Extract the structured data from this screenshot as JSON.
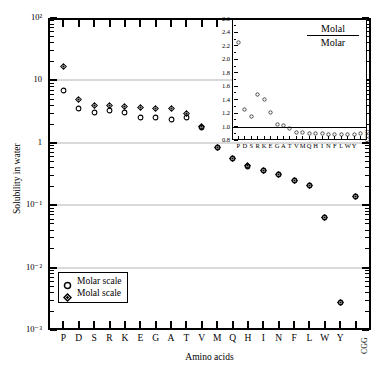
{
  "chart_data": {
    "type": "scatter",
    "title": "",
    "xlabel": "Amino acids",
    "ylabel": "Solubility in water",
    "yscale": "log",
    "ylim": [
      0.001,
      100
    ],
    "ytick_labels": [
      "10²",
      "10",
      "1",
      "10⁻¹",
      "10⁻²",
      "10⁻³"
    ],
    "ytick_values": [
      100,
      10,
      1,
      0.1,
      0.01,
      0.001
    ],
    "grid": "horizontal",
    "categories": [
      "P",
      "D",
      "S",
      "R",
      "K",
      "E",
      "G",
      "A",
      "T",
      "V",
      "M",
      "Q",
      "H",
      "I",
      "N",
      "F",
      "L",
      "W",
      "Y",
      "CGG"
    ],
    "legend_position": "lower-left",
    "series": [
      {
        "name": "Molar scale",
        "marker": "open-circle",
        "values": [
          6.9,
          3.6,
          3.1,
          3.3,
          3.1,
          2.5,
          2.5,
          2.4,
          2.5,
          1.75,
          0.83,
          0.56,
          0.42,
          0.36,
          0.31,
          0.25,
          0.21,
          0.063,
          0.0028,
          0.14
        ]
      },
      {
        "name": "Molal scale",
        "marker": "open-diamond",
        "values": [
          16.5,
          5.0,
          3.9,
          4.0,
          3.8,
          3.7,
          3.6,
          3.5,
          3.0,
          1.85,
          0.84,
          0.57,
          0.43,
          0.36,
          0.31,
          0.25,
          0.21,
          0.063,
          0.0028,
          0.14
        ]
      }
    ]
  },
  "inset_chart_data": {
    "type": "scatter",
    "title": "",
    "label_numerator": "Molal",
    "label_denominator": "Molar",
    "ylim": [
      0.8,
      2.6
    ],
    "ytick_values": [
      0.8,
      1.0,
      1.2,
      1.4,
      1.6,
      1.8,
      2.0,
      2.2,
      2.4,
      2.6
    ],
    "ytick_labels": [
      "0.8",
      "1.0",
      "1.2",
      "1.4",
      "1.6",
      "1.8",
      "2.0",
      "2.2",
      "2.4",
      "2.6"
    ],
    "reference_line": 1.0,
    "marker": "open-circle",
    "categories": [
      "P",
      "D",
      "S",
      "R",
      "K",
      "E",
      "G",
      "A",
      "T",
      "V",
      "M",
      "Q",
      "H",
      "I",
      "N",
      "F",
      "L",
      "W",
      "Y",
      "CGG"
    ],
    "values": [
      2.38,
      1.39,
      1.28,
      1.61,
      1.53,
      1.35,
      1.17,
      1.15,
      1.1,
      1.05,
      1.04,
      1.03,
      1.03,
      1.03,
      1.02,
      1.02,
      1.02,
      1.01,
      1.01,
      1.03
    ]
  },
  "legend": {
    "items": [
      {
        "label": "Molar scale",
        "marker": "open-circle"
      },
      {
        "label": "Molal scale",
        "marker": "open-diamond"
      }
    ]
  }
}
